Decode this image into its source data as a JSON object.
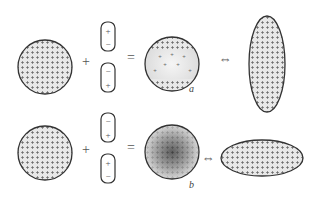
{
  "operators": {
    "plus": "+",
    "equals": "=",
    "equivalent": "⇔"
  },
  "rows": [
    {
      "id": "top",
      "capsules": [
        {
          "top": "+",
          "bottom": "−"
        },
        {
          "top": "−",
          "bottom": "+"
        }
      ],
      "result_label": "a",
      "result_description": "charges concentrated at top and bottom poles",
      "shape": "vertical-ellipse"
    },
    {
      "id": "bottom",
      "capsules": [
        {
          "top": "−",
          "bottom": "+"
        },
        {
          "top": "+",
          "bottom": "−"
        }
      ],
      "result_label": "b",
      "result_description": "charges concentrated at center (dark shading)",
      "shape": "horizontal-ellipse"
    }
  ],
  "colors": {
    "outline": "#333333",
    "fill_light": "#e6e6e6",
    "plus_mark": "#555555",
    "dark_center": "#3a3a3a"
  }
}
